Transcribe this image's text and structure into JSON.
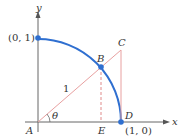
{
  "diagram": {
    "type": "unit-circle-quadrant-geometry",
    "colors": {
      "arc": "#2f6fd0",
      "triangle_lines": "#e8a0a0",
      "dashed": "#e08a8a",
      "axes": "#666666",
      "points": "#2f6fd0",
      "text": "#333333"
    },
    "axes": {
      "x_label": "x",
      "y_label": "y"
    },
    "labels": {
      "point_01": "(0, 1)",
      "point_10": "(1, 0)",
      "A": "A",
      "B": "B",
      "C": "C",
      "D": "D",
      "E": "E",
      "theta": "θ",
      "radius": "1"
    },
    "points": [
      {
        "name": "A",
        "coord": "(0, 0)"
      },
      {
        "name": "B",
        "coord": "on arc"
      },
      {
        "name": "C",
        "coord": "(1, tan θ)"
      },
      {
        "name": "D",
        "coord": "(1, 0)"
      },
      {
        "name": "E",
        "coord": "(cos θ, 0)"
      },
      {
        "name": "top",
        "coord": "(0, 1)"
      }
    ]
  }
}
